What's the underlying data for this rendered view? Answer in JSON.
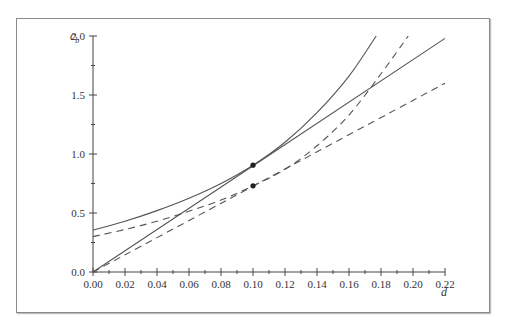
{
  "chart_data": {
    "type": "line",
    "title": "",
    "xlabel": "d",
    "ylabel": "c_b",
    "xlim": [
      0.0,
      0.22
    ],
    "ylim": [
      0.0,
      2.0
    ],
    "grid": false,
    "legend": null,
    "x_ticks": [
      "0.00",
      "0.02",
      "0.04",
      "0.06",
      "0.08",
      "0.10",
      "0.12",
      "0.14",
      "0.16",
      "0.18",
      "0.20",
      "0.22"
    ],
    "y_ticks": [
      "0.0",
      "0.5",
      "1.0",
      "1.5",
      "2.0"
    ],
    "series": [
      {
        "name": "solid curve",
        "style": "solid",
        "x": [
          0,
          0.02,
          0.04,
          0.06,
          0.08,
          0.1,
          0.12,
          0.14,
          0.16,
          0.177
        ],
        "y": [
          0.355,
          0.43,
          0.52,
          0.625,
          0.75,
          0.905,
          1.1,
          1.35,
          1.66,
          2.0
        ]
      },
      {
        "name": "solid tangent line",
        "style": "solid",
        "x": [
          0,
          0.22
        ],
        "y": [
          0,
          1.98
        ]
      },
      {
        "name": "dashed curve",
        "style": "dashed",
        "x": [
          0,
          0.02,
          0.04,
          0.06,
          0.08,
          0.1,
          0.12,
          0.14,
          0.16,
          0.18,
          0.197
        ],
        "y": [
          0.3,
          0.36,
          0.43,
          0.515,
          0.61,
          0.73,
          0.87,
          1.07,
          1.33,
          1.68,
          2.0
        ]
      },
      {
        "name": "dashed tangent line",
        "style": "dashed",
        "x": [
          0,
          0.22
        ],
        "y": [
          0,
          1.6
        ]
      }
    ],
    "points": [
      {
        "x": 0.1,
        "y": 0.905,
        "label": "tangent point (solid)"
      },
      {
        "x": 0.1,
        "y": 0.73,
        "label": "tangent point (dashed)"
      }
    ]
  },
  "colors": {
    "line": "#555555",
    "axis": "#444444",
    "frame": "#8a8a8a",
    "dot": "#222222"
  }
}
